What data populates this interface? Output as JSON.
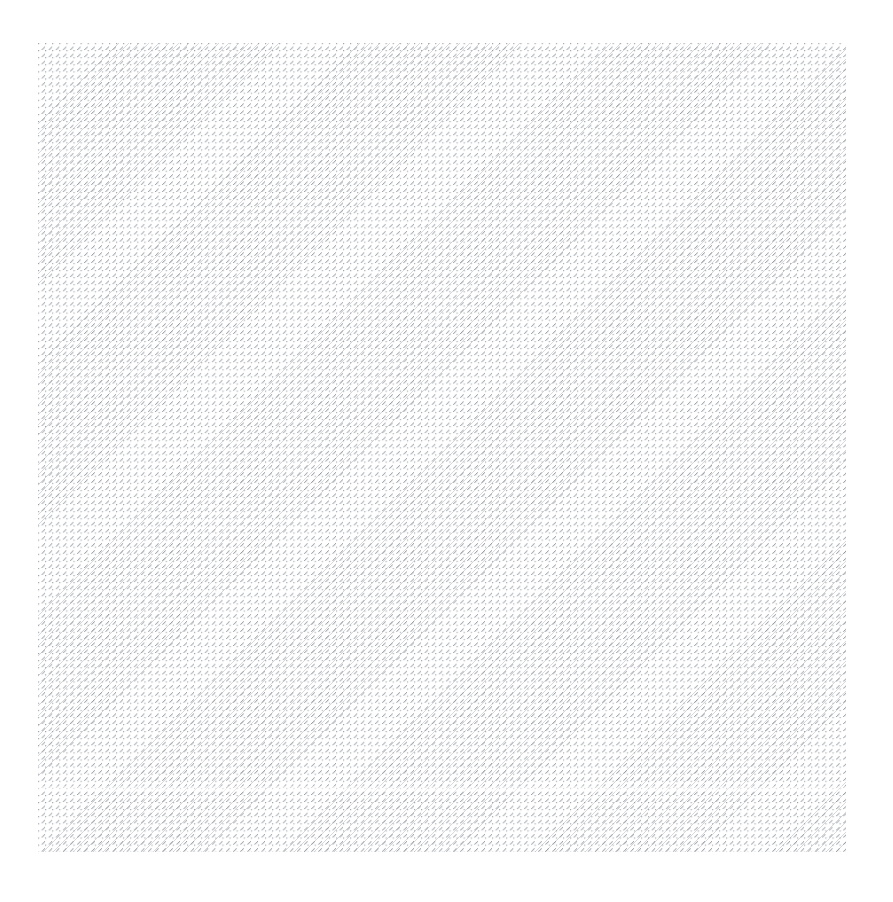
{
  "page": {
    "width": 893,
    "height": 902,
    "background_color": "#ffffff",
    "description": "Blank white page containing a single large rectangular area filled with a fine diagonal hatch pattern. No text, controls, or iconography are rendered."
  },
  "hatch_region": {
    "name": "hatched-placeholder",
    "x": 38,
    "y": 43,
    "width": 808,
    "height": 809,
    "fill_color": "#ffffff",
    "line_color": "#9aa0a6",
    "line_angle_degrees": 135,
    "line_spacing_px": 7,
    "line_width_px": 1,
    "label": ""
  },
  "margins": {
    "left_px": 38,
    "top_px": 43,
    "right_px": 47,
    "bottom_px": 50,
    "color": "#ffffff"
  },
  "artifacts": {
    "seam": {
      "name": "horizontal-seam-artifact",
      "y": 786,
      "height_px": 6,
      "note": "Faint lighter horizontal band; rendering/aliasing artifact, not content."
    }
  },
  "content": {
    "text_elements": [],
    "icons": [],
    "controls": [],
    "caption": ""
  }
}
